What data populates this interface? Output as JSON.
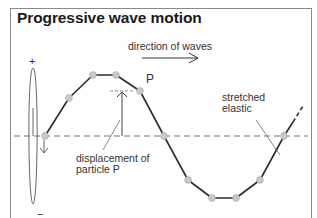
{
  "title": "Progressive wave motion",
  "labels": {
    "direction": "direction of waves",
    "point_p": "P",
    "stretched_line1": "stretched",
    "stretched_line2": "elastic",
    "displacement_line1": "displacement of",
    "displacement_line2": "particle P",
    "plus": "+",
    "minus": "−"
  },
  "colors": {
    "wave": "#2b2b2b",
    "particle": "#c8c8c8",
    "axis_dashed": "#777777",
    "border": "#8a8a8a"
  },
  "wave_points": [
    [
      45,
      136
    ],
    [
      69,
      98
    ],
    [
      93,
      75
    ],
    [
      116,
      75
    ],
    [
      140,
      91
    ],
    [
      164,
      136
    ],
    [
      188,
      180
    ],
    [
      212,
      198
    ],
    [
      236,
      198
    ],
    [
      260,
      180
    ],
    [
      284,
      136
    ]
  ]
}
